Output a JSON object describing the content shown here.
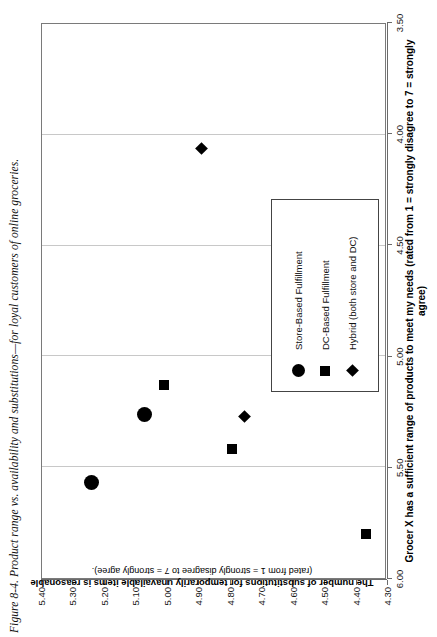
{
  "caption": "Figure 8-4.  Product range vs. availability and substitutions—for loyal customers of online groceries.",
  "chart_data": {
    "type": "scatter",
    "title": "Product range vs. availability and substitutions—for loyal customers of online groceries.",
    "xlabel": "Grocer X has a sufficient range of products to meet my needs (rated from 1 = strongly disagree to 7 = strongly agree)",
    "xlabel_main": "Grocer X has a sufficient range of products to meet my needs (rated from 1 = strongly disagree to 7 = strongly",
    "xlabel_cont": "agree)",
    "ylabel": "The number of substitutions for temporarily unavailable items is reasonable",
    "ylabel_sub": "(rated from 1 = strongly disagree to 7 = strongly agree).",
    "xlim": [
      4.3,
      5.4
    ],
    "ylim": [
      3.5,
      6.0
    ],
    "xticks": [
      "4.30",
      "4.40",
      "4.50",
      "4.60",
      "4.70",
      "4.80",
      "4.90",
      "5.00",
      "5.10",
      "5.20",
      "5.30",
      "5.40"
    ],
    "xtick_values": [
      4.3,
      4.4,
      4.5,
      4.6,
      4.7,
      4.8,
      4.9,
      5.0,
      5.1,
      5.2,
      5.3,
      5.4
    ],
    "yticks": [
      "3.50",
      "4.00",
      "4.50",
      "5.00",
      "5.50",
      "6.00"
    ],
    "ytick_values": [
      3.5,
      4.0,
      4.5,
      5.0,
      5.5,
      6.0
    ],
    "grid": "vertical-gridlines-at-y-major-ticks",
    "legend_position": "lower-right-inside",
    "series": [
      {
        "name": "Store-Based Fulfillment",
        "marker": "circle",
        "points": [
          {
            "x": 5.24,
            "y": 5.57
          },
          {
            "x": 5.07,
            "y": 5.26
          }
        ]
      },
      {
        "name": "DC-Based Fulfillment",
        "marker": "square",
        "points": [
          {
            "x": 5.01,
            "y": 5.13
          },
          {
            "x": 4.79,
            "y": 5.42
          },
          {
            "x": 4.36,
            "y": 5.8
          }
        ]
      },
      {
        "name": "Hybrid (both store and DC)",
        "marker": "diamond",
        "points": [
          {
            "x": 4.89,
            "y": 4.06
          },
          {
            "x": 4.75,
            "y": 5.27
          }
        ]
      }
    ]
  },
  "legend": {
    "items": [
      {
        "label": "Store-Based Fulfillment",
        "marker": "circle"
      },
      {
        "label": "DC-Based Fulfillment",
        "marker": "square"
      },
      {
        "label": "Hybrid (both store and DC)",
        "marker": "diamond"
      }
    ]
  },
  "colors": {
    "marker": "#000000",
    "frame": "#7a7a7a",
    "gridline": "#c8c8c8",
    "background": "#ffffff"
  }
}
